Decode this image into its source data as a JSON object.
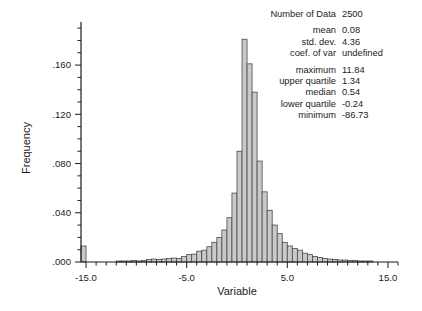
{
  "chart_data": {
    "type": "bar",
    "title": "",
    "subtitle": "",
    "xlabel": "Variable",
    "ylabel": "Frequency",
    "xlim": [
      -15.5,
      16.0
    ],
    "ylim": [
      0.0,
      0.195
    ],
    "grid": false,
    "legend": null,
    "bin_width": 0.5,
    "xticks": [
      -15.0,
      -5.0,
      5.0,
      15.0
    ],
    "xtick_labels": [
      "-15.0",
      "-5.0",
      "5.0",
      "15.0"
    ],
    "yticks": [
      0.0,
      0.04,
      0.08,
      0.12,
      0.16
    ],
    "ytick_labels": [
      ".000",
      ".040",
      ".080",
      ".120",
      ".160"
    ],
    "x_minor_tick_step": 1.0,
    "y_minor_tick_step": 0.01,
    "bar_fill": "#c9c9c9",
    "bar_stroke": "#4a4a4a",
    "axis_color": "#1b1b1b",
    "bin_centers": [
      -15.25,
      -14.75,
      -14.25,
      -13.75,
      -13.25,
      -12.75,
      -12.25,
      -11.75,
      -11.25,
      -10.75,
      -10.25,
      -9.75,
      -9.25,
      -8.75,
      -8.25,
      -7.75,
      -7.25,
      -6.75,
      -6.25,
      -5.75,
      -5.25,
      -4.75,
      -4.25,
      -3.75,
      -3.25,
      -2.75,
      -2.25,
      -1.75,
      -1.25,
      -0.75,
      -0.25,
      0.25,
      0.75,
      1.25,
      1.75,
      2.25,
      2.75,
      3.25,
      3.75,
      4.25,
      4.75,
      5.25,
      5.75,
      6.25,
      6.75,
      7.25,
      7.75,
      8.25,
      8.75,
      9.25,
      9.75,
      10.25,
      10.75,
      11.25,
      11.75,
      12.25,
      12.75,
      13.25
    ],
    "values": [
      0.013,
      0.0,
      0.0,
      0.0,
      0.0,
      0.0,
      0.0,
      0.0008,
      0.0008,
      0.0008,
      0.0012,
      0.0008,
      0.0012,
      0.002,
      0.0024,
      0.002,
      0.0024,
      0.0028,
      0.0032,
      0.0028,
      0.0044,
      0.006,
      0.0064,
      0.0088,
      0.0096,
      0.0124,
      0.016,
      0.02,
      0.026,
      0.036,
      0.056,
      0.09,
      0.181,
      0.161,
      0.138,
      0.082,
      0.057,
      0.042,
      0.03,
      0.023,
      0.016,
      0.013,
      0.011,
      0.0096,
      0.0072,
      0.006,
      0.0044,
      0.0036,
      0.0028,
      0.0024,
      0.002,
      0.0016,
      0.0016,
      0.0012,
      0.0012,
      0.0008,
      0.0008,
      0.0008
    ]
  },
  "stats": {
    "rows_top": [
      {
        "label": "Number of Data",
        "value": "2500"
      }
    ],
    "rows_mid": [
      {
        "label": "mean",
        "value": "0.08"
      },
      {
        "label": "std. dev.",
        "value": "4.36"
      },
      {
        "label": "coef. of var",
        "value": "undefined"
      }
    ],
    "rows_bottom": [
      {
        "label": "maximum",
        "value": "11.84"
      },
      {
        "label": "upper quartile",
        "value": "1.34"
      },
      {
        "label": "median",
        "value": "0.54"
      },
      {
        "label": "lower quartile",
        "value": "-0.24"
      },
      {
        "label": "minimum",
        "value": "-86.73"
      }
    ]
  }
}
